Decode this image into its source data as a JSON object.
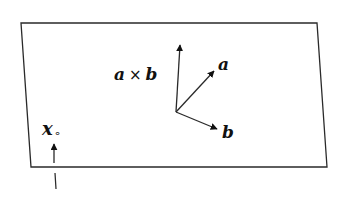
{
  "diagram": {
    "type": "vector plane illustration",
    "colors": {
      "stroke": "#2a2a2a",
      "text": "#111111",
      "background": "#ffffff"
    },
    "plane": {
      "corners": [
        [
          21,
          23
        ],
        [
          317,
          23
        ],
        [
          327,
          167
        ],
        [
          31,
          167
        ]
      ]
    },
    "origin": [
      176,
      112
    ],
    "vectors": [
      {
        "id": "cross",
        "label_left": "a",
        "operator": "×",
        "label_right": "b",
        "tip": [
          180,
          43
        ],
        "label_pos": [
          114,
          80
        ]
      },
      {
        "id": "a",
        "label": "a",
        "tip": [
          215,
          70
        ],
        "label_pos": [
          218,
          70
        ]
      },
      {
        "id": "b",
        "label": "b",
        "tip": [
          218,
          130
        ],
        "label_pos": [
          222,
          138
        ]
      }
    ],
    "point": {
      "label": "x",
      "subscript": "∘",
      "label_pos": [
        43,
        135
      ],
      "arrow_from": [
        54,
        163
      ],
      "arrow_to": [
        54,
        142
      ],
      "below_line_from": [
        55,
        173
      ],
      "below_line_to": [
        56,
        189
      ]
    }
  }
}
